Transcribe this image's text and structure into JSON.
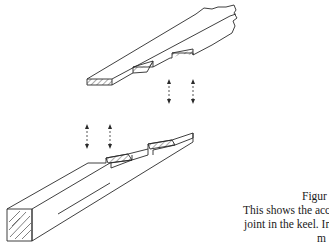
{
  "figure": {
    "title_fragment": "Figur",
    "caption_lines": [
      "This shows the accur",
      "joint in the keel. In s",
      "m"
    ],
    "parts": [
      {
        "name": "upper-timber",
        "features": [
          "hatched end grain",
          "two stepped notches on underside",
          "broken-off far end"
        ]
      },
      {
        "name": "lower-timber",
        "features": [
          "square hatched end grain with wood-grain lines",
          "two stepped raised tabs on top"
        ]
      }
    ],
    "arrows": [
      {
        "group": "upper",
        "count": 2,
        "style": "double-headed dashed vertical"
      },
      {
        "group": "lower",
        "count": 2,
        "style": "double-headed dashed vertical"
      }
    ],
    "colors": {
      "line": "#2a2a2a",
      "background": "#ffffff",
      "text": "#1a1a1a"
    }
  }
}
